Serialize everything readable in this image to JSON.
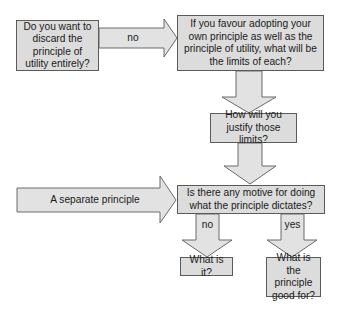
{
  "diagram": {
    "type": "flowchart",
    "nodes": {
      "q_discard": "Do you want to discard the principle of utility entirely?",
      "q_limits": "If you favour adopting your own principle as well as the principle of utility, what will be the limits of each?",
      "q_justify": "How will you justify those limits?",
      "q_motive": "Is there any motive for doing what the principle dictates?",
      "q_what_is_it": "What is it?",
      "q_good_for": "What is the principle good for?"
    },
    "edges": {
      "discard_to_limits": "no",
      "separate_principle": "A separate principle",
      "motive_no": "no",
      "motive_yes": "yes"
    },
    "colors": {
      "box_fill": "#dcdcdc",
      "arrow_fill": "#e2e2e2",
      "stroke": "#5a5a5a"
    }
  }
}
